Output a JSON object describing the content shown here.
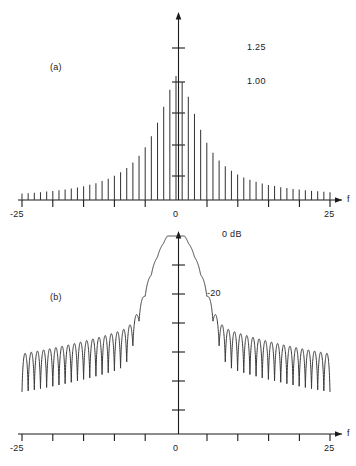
{
  "figure": {
    "panels": [
      {
        "tag": "(a)",
        "type": "line-spectrum-linear",
        "x_axis": {
          "label": "f",
          "min": -25,
          "max": 25,
          "ticks_major": [
            -25,
            0,
            25
          ],
          "tick_labels": [
            "-25",
            "0",
            "25"
          ],
          "tick_step": 5
        },
        "y_axis": {
          "tick_labels": [
            "1.25",
            "1.00"
          ],
          "unit": ""
        }
      },
      {
        "tag": "(b)",
        "type": "spectrum-db",
        "x_axis": {
          "label": "f",
          "min": -25,
          "max": 25,
          "ticks_major": [
            -25,
            0,
            25
          ],
          "tick_labels": [
            "-25",
            "0",
            "25"
          ],
          "tick_step": 5
        },
        "y_axis": {
          "tick_labels": [
            "0 dB",
            "-20"
          ],
          "unit": "dB"
        }
      }
    ]
  },
  "chart_data": [
    {
      "type": "bar",
      "title": "(a)",
      "xlabel": "f",
      "ylabel": "",
      "xlim": [
        -25,
        25
      ],
      "ylim": [
        0,
        1.45
      ],
      "grid": false,
      "legend": null,
      "ytick_values": [
        1.25,
        1.0,
        0.75,
        0.5,
        0.25
      ],
      "ytick_labels": [
        "1.25",
        "1.00",
        "",
        "",
        ""
      ],
      "xtick_values": [
        -25,
        -20,
        -15,
        -10,
        -5,
        0,
        5,
        10,
        15,
        20,
        25
      ],
      "xtick_labels": [
        "-25",
        "",
        "",
        "",
        "",
        "0",
        "",
        "",
        "",
        "",
        "25"
      ],
      "note": "Discrete line spectrum; stems at every integer f from -25 to 25; Lorentzian-like envelope peaking near f=0",
      "categories": [
        -25,
        -24,
        -23,
        -22,
        -21,
        -20,
        -19,
        -18,
        -17,
        -16,
        -15,
        -14,
        -13,
        -12,
        -11,
        -10,
        -9,
        -8,
        -7,
        -6,
        -5,
        -4,
        -3,
        -2,
        -1,
        0,
        1,
        2,
        3,
        4,
        5,
        6,
        7,
        8,
        9,
        10,
        11,
        12,
        13,
        14,
        15,
        16,
        17,
        18,
        19,
        20,
        21,
        22,
        23,
        24,
        25
      ],
      "values": [
        0.055,
        0.058,
        0.062,
        0.066,
        0.071,
        0.076,
        0.082,
        0.089,
        0.097,
        0.106,
        0.117,
        0.129,
        0.143,
        0.16,
        0.181,
        0.205,
        0.235,
        0.272,
        0.318,
        0.375,
        0.448,
        0.54,
        0.655,
        0.79,
        0.935,
        1.05,
        1.0,
        0.875,
        0.73,
        0.595,
        0.485,
        0.4,
        0.335,
        0.285,
        0.247,
        0.216,
        0.191,
        0.171,
        0.154,
        0.14,
        0.128,
        0.118,
        0.109,
        0.101,
        0.094,
        0.088,
        0.083,
        0.078,
        0.074,
        0.07,
        0.066
      ]
    },
    {
      "type": "line",
      "title": "(b)",
      "xlabel": "f",
      "ylabel": "dB",
      "xlim": [
        -25,
        25
      ],
      "ylim": [
        -62,
        3
      ],
      "grid": false,
      "legend": null,
      "ytick_values": [
        0,
        -10,
        -20,
        -30,
        -40,
        -50
      ],
      "ytick_labels": [
        "0 dB",
        "",
        "-20",
        "",
        "",
        ""
      ],
      "xtick_values": [
        -25,
        -20,
        -15,
        -10,
        -5,
        0,
        5,
        10,
        15,
        20,
        25
      ],
      "xtick_labels": [
        "-25",
        "",
        "",
        "",
        "",
        "0",
        "",
        "",
        "",
        "",
        "25"
      ],
      "note": "Same spectrum on a logarithmic (dB) scale; main lobe near f=0 at 0 dB, shoulders near -13 dB, oscillating sidelobes falling to roughly -26 to -55 dB with deep nulls"
    }
  ]
}
